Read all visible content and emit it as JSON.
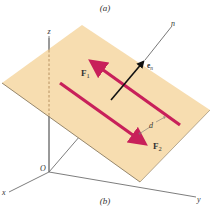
{
  "figure": {
    "top_caption": "(a)",
    "bottom_caption": "(b)"
  },
  "axes": {
    "z_label": "z",
    "x_label": "x",
    "y_label": "y",
    "origin_label": "O"
  },
  "normal": {
    "axis_label": "n",
    "unit_vector_label_main": "e",
    "unit_vector_label_sub": "n"
  },
  "forces": [
    {
      "label_main": "F",
      "label_sub": "1"
    },
    {
      "label_main": "F",
      "label_sub": "2"
    }
  ],
  "distance_label": "d",
  "colors": {
    "plane_fill": "#F7DDB0",
    "plane_edge": "#8A7A60",
    "force_color": "#C8205A",
    "axis_color": "#6E6E6E",
    "normal_vector": "#111111"
  }
}
